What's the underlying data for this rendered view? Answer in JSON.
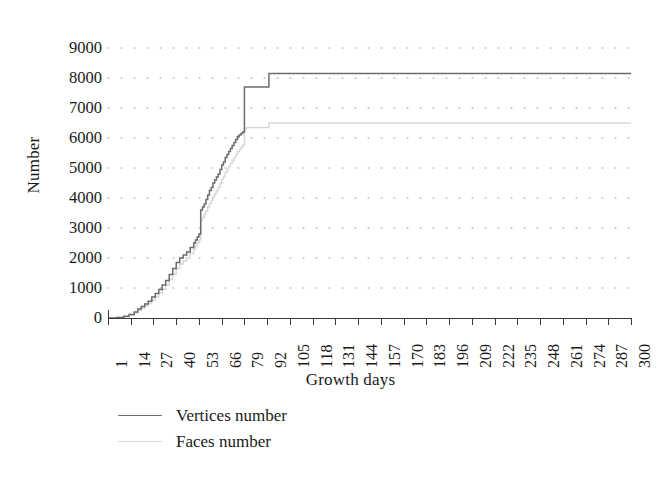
{
  "chart_data": {
    "type": "line",
    "title": "",
    "xlabel": "Growth days",
    "ylabel": "Number",
    "xlim": [
      1,
      300
    ],
    "ylim": [
      0,
      9000
    ],
    "grid": true,
    "grid_style": "dotted",
    "legend_position": "bottom-left",
    "x_tick_labels": [
      "1",
      "14",
      "27",
      "40",
      "53",
      "66",
      "79",
      "92",
      "105",
      "118",
      "131",
      "144",
      "157",
      "170",
      "183",
      "196",
      "209",
      "222",
      "235",
      "248",
      "261",
      "274",
      "287",
      "300"
    ],
    "y_tick_labels": [
      "0",
      "1000",
      "2000",
      "3000",
      "4000",
      "5000",
      "6000",
      "7000",
      "8000",
      "9000"
    ],
    "y_tick_values": [
      0,
      1000,
      2000,
      3000,
      4000,
      5000,
      6000,
      7000,
      8000,
      9000
    ],
    "series": [
      {
        "name": "Vertices number",
        "color": "#6b6b6b",
        "x": [
          1,
          6,
          10,
          13,
          16,
          18,
          20,
          22,
          24,
          26,
          28,
          30,
          32,
          34,
          36,
          38,
          40,
          42,
          44,
          46,
          48,
          50,
          51,
          52,
          53,
          54,
          55,
          56,
          57,
          58,
          59,
          60,
          61,
          62,
          63,
          64,
          65,
          66,
          67,
          68,
          69,
          70,
          71,
          72,
          73,
          74,
          75,
          76,
          77,
          78,
          79,
          80,
          81,
          92,
          93,
          300
        ],
        "y": [
          0,
          20,
          60,
          120,
          200,
          300,
          380,
          470,
          560,
          700,
          820,
          950,
          1100,
          1250,
          1450,
          1650,
          1850,
          2000,
          2100,
          2200,
          2350,
          2500,
          2600,
          2700,
          2800,
          3600,
          3700,
          3800,
          3950,
          4100,
          4250,
          4350,
          4500,
          4600,
          4700,
          4800,
          4950,
          5100,
          5200,
          5350,
          5450,
          5550,
          5650,
          5750,
          5850,
          5950,
          6050,
          6100,
          6150,
          6200,
          7700,
          7700,
          7700,
          7700,
          8150,
          8150
        ]
      },
      {
        "name": "Faces number",
        "color": "#d8d8d8",
        "x": [
          1,
          6,
          10,
          13,
          16,
          18,
          20,
          22,
          24,
          26,
          28,
          30,
          32,
          34,
          36,
          38,
          40,
          42,
          44,
          46,
          48,
          50,
          51,
          52,
          53,
          54,
          55,
          56,
          57,
          58,
          59,
          60,
          61,
          62,
          63,
          64,
          65,
          66,
          67,
          68,
          69,
          70,
          71,
          72,
          73,
          74,
          75,
          76,
          77,
          78,
          79,
          80,
          81,
          92,
          93,
          300
        ],
        "y": [
          0,
          15,
          45,
          95,
          165,
          250,
          320,
          400,
          480,
          600,
          710,
          830,
          960,
          1100,
          1280,
          1470,
          1650,
          1800,
          1900,
          2000,
          2150,
          2300,
          2400,
          2500,
          2600,
          3250,
          3350,
          3450,
          3570,
          3700,
          3820,
          3920,
          4050,
          4150,
          4250,
          4350,
          4480,
          4620,
          4720,
          4850,
          4950,
          5050,
          5150,
          5250,
          5350,
          5450,
          5540,
          5600,
          5680,
          5760,
          6300,
          6330,
          6350,
          6350,
          6500,
          6500
        ]
      }
    ]
  },
  "legend": {
    "items": [
      {
        "label": "Vertices number",
        "color": "#6b6b6b"
      },
      {
        "label": "Faces number",
        "color": "#d8d8d8"
      }
    ]
  }
}
